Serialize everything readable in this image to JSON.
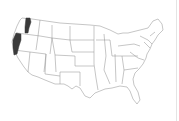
{
  "map": {
    "subject": "United States (contiguous) state outline map",
    "highlighted_regions": [
      {
        "name": "western-washington-strip",
        "state": "Washington",
        "color": "#3a3a3a"
      },
      {
        "name": "oregon-northern-california-coast",
        "state": "Oregon / California",
        "color": "#3a3a3a"
      }
    ],
    "colors": {
      "background": "#ffffff",
      "state_fill": "#ffffff",
      "state_border": "#8c8c8c",
      "highlight": "#3a3a3a"
    }
  }
}
